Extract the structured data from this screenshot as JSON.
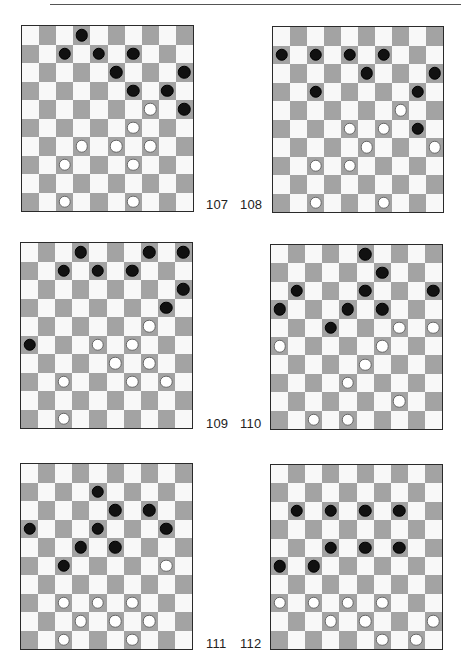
{
  "page": {
    "board_size": 10,
    "colors": {
      "dark_square": "#a3a3a3",
      "light_square": "#f8f8f8",
      "black_piece": "#111111",
      "white_piece": "#ffffff",
      "border": "#2a2a2a"
    }
  },
  "diagrams": [
    {
      "number": "107",
      "black": [
        [
          0,
          3
        ],
        [
          1,
          2
        ],
        [
          1,
          4
        ],
        [
          1,
          6
        ],
        [
          2,
          5
        ],
        [
          2,
          9
        ],
        [
          3,
          6
        ],
        [
          3,
          8
        ],
        [
          4,
          9
        ]
      ],
      "white": [
        [
          4,
          7
        ],
        [
          5,
          6
        ],
        [
          6,
          3
        ],
        [
          6,
          5
        ],
        [
          6,
          7
        ],
        [
          7,
          2
        ],
        [
          7,
          6
        ],
        [
          9,
          2
        ],
        [
          9,
          6
        ]
      ]
    },
    {
      "number": "108",
      "black": [
        [
          1,
          0
        ],
        [
          1,
          2
        ],
        [
          1,
          4
        ],
        [
          1,
          6
        ],
        [
          2,
          5
        ],
        [
          2,
          9
        ],
        [
          3,
          2
        ],
        [
          3,
          8
        ],
        [
          5,
          8
        ]
      ],
      "white": [
        [
          4,
          7
        ],
        [
          5,
          4
        ],
        [
          5,
          6
        ],
        [
          6,
          5
        ],
        [
          6,
          9
        ],
        [
          7,
          2
        ],
        [
          7,
          4
        ],
        [
          9,
          2
        ],
        [
          9,
          6
        ]
      ]
    },
    {
      "number": "109",
      "black": [
        [
          0,
          3
        ],
        [
          0,
          7
        ],
        [
          0,
          9
        ],
        [
          1,
          2
        ],
        [
          1,
          4
        ],
        [
          1,
          6
        ],
        [
          2,
          9
        ],
        [
          3,
          8
        ],
        [
          5,
          0
        ]
      ],
      "white": [
        [
          4,
          7
        ],
        [
          5,
          4
        ],
        [
          5,
          6
        ],
        [
          6,
          5
        ],
        [
          6,
          7
        ],
        [
          7,
          2
        ],
        [
          7,
          6
        ],
        [
          7,
          8
        ],
        [
          9,
          2
        ]
      ]
    },
    {
      "number": "110",
      "black": [
        [
          0,
          5
        ],
        [
          1,
          6
        ],
        [
          2,
          1
        ],
        [
          2,
          5
        ],
        [
          2,
          9
        ],
        [
          3,
          0
        ],
        [
          3,
          4
        ],
        [
          3,
          6
        ],
        [
          4,
          3
        ]
      ],
      "white": [
        [
          4,
          7
        ],
        [
          4,
          9
        ],
        [
          5,
          0
        ],
        [
          5,
          6
        ],
        [
          6,
          5
        ],
        [
          7,
          4
        ],
        [
          8,
          7
        ],
        [
          9,
          2
        ],
        [
          9,
          4
        ]
      ]
    },
    {
      "number": "111",
      "black": [
        [
          1,
          4
        ],
        [
          2,
          5
        ],
        [
          2,
          7
        ],
        [
          3,
          0
        ],
        [
          3,
          4
        ],
        [
          3,
          8
        ],
        [
          4,
          3
        ],
        [
          4,
          5
        ],
        [
          5,
          2
        ]
      ],
      "white": [
        [
          5,
          8
        ],
        [
          7,
          2
        ],
        [
          7,
          4
        ],
        [
          7,
          6
        ],
        [
          8,
          3
        ],
        [
          8,
          5
        ],
        [
          8,
          7
        ],
        [
          9,
          2
        ],
        [
          9,
          6
        ]
      ]
    },
    {
      "number": "112",
      "black": [
        [
          2,
          1
        ],
        [
          2,
          3
        ],
        [
          2,
          5
        ],
        [
          2,
          7
        ],
        [
          4,
          3
        ],
        [
          4,
          5
        ],
        [
          4,
          7
        ],
        [
          5,
          0
        ],
        [
          5,
          2
        ]
      ],
      "white": [
        [
          7,
          0
        ],
        [
          7,
          2
        ],
        [
          7,
          4
        ],
        [
          7,
          6
        ],
        [
          8,
          3
        ],
        [
          8,
          5
        ],
        [
          8,
          9
        ],
        [
          9,
          6
        ],
        [
          9,
          8
        ]
      ]
    }
  ]
}
